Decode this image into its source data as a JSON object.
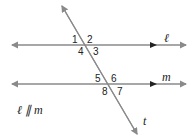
{
  "diagram": {
    "lines": {
      "l": {
        "label": "ℓ"
      },
      "m": {
        "label": "m"
      },
      "t": {
        "label": "t"
      }
    },
    "angles": [
      "1",
      "2",
      "3",
      "4",
      "5",
      "6",
      "7",
      "8"
    ],
    "caption": "ℓ ∥ m",
    "colors": {
      "line": "#8a8a8a",
      "arrow": "#222222",
      "text": "#222222"
    }
  }
}
